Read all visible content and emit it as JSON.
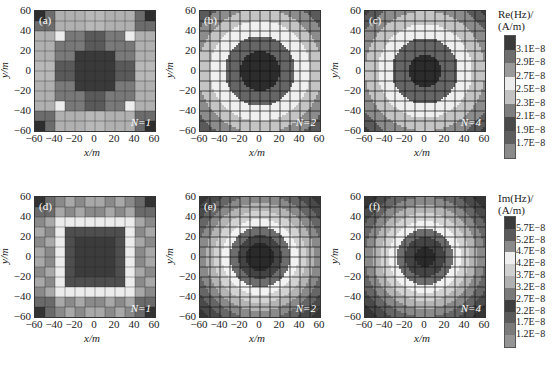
{
  "chart_data": [
    {
      "id": "a",
      "type": "heatmap",
      "panel_label": "(a)",
      "annotation": "N=1",
      "quantity": "Re(Hz)",
      "xlabel": "x/m",
      "ylabel": "y/m",
      "xlim": [
        -60,
        60
      ],
      "ylim": [
        -60,
        60
      ],
      "xticks": [
        -60,
        -40,
        -20,
        0,
        20,
        40,
        60
      ],
      "yticks": [
        -60,
        -40,
        -20,
        0,
        20,
        40,
        60
      ],
      "style": "blocky",
      "grid": true
    },
    {
      "id": "b",
      "type": "heatmap",
      "panel_label": "(b)",
      "annotation": "N=2",
      "quantity": "Re(Hz)",
      "xlabel": "x/m",
      "ylabel": "y/m",
      "xlim": [
        -60,
        60
      ],
      "ylim": [
        -60,
        60
      ],
      "xticks": [
        -60,
        -40,
        -20,
        0,
        20,
        40,
        60
      ],
      "yticks": [
        -60,
        -40,
        -20,
        0,
        20,
        40,
        60
      ],
      "style": "concentric contours",
      "grid": true
    },
    {
      "id": "c",
      "type": "heatmap",
      "panel_label": "(c)",
      "annotation": "N=4",
      "quantity": "Re(Hz)",
      "xlabel": "x/m",
      "ylabel": "y/m",
      "xlim": [
        -60,
        60
      ],
      "ylim": [
        -60,
        60
      ],
      "xticks": [
        -60,
        -40,
        -20,
        0,
        20,
        40,
        60
      ],
      "yticks": [
        -60,
        -40,
        -20,
        0,
        20,
        40,
        60
      ],
      "style": "concentric contours",
      "grid": true
    },
    {
      "id": "d",
      "type": "heatmap",
      "panel_label": "(d)",
      "annotation": "N=1",
      "quantity": "Im(Hz)",
      "xlabel": "x/m",
      "ylabel": "y/m",
      "xlim": [
        -60,
        60
      ],
      "ylim": [
        -60,
        60
      ],
      "xticks": [
        -60,
        -40,
        -20,
        0,
        20,
        40,
        60
      ],
      "yticks": [
        -60,
        -40,
        -20,
        0,
        20,
        40,
        60
      ],
      "style": "blocky",
      "grid": true
    },
    {
      "id": "e",
      "type": "heatmap",
      "panel_label": "(e)",
      "annotation": "N=2",
      "quantity": "Im(Hz)",
      "xlabel": "x/m",
      "ylabel": "y/m",
      "xlim": [
        -60,
        60
      ],
      "ylim": [
        -60,
        60
      ],
      "xticks": [
        -60,
        -40,
        -20,
        0,
        20,
        40,
        60
      ],
      "yticks": [
        -60,
        -40,
        -20,
        0,
        20,
        40,
        60
      ],
      "style": "concentric contours",
      "grid": true
    },
    {
      "id": "f",
      "type": "heatmap",
      "panel_label": "(f)",
      "annotation": "N=4",
      "quantity": "Im(Hz)",
      "xlabel": "x/m",
      "ylabel": "y/m",
      "xlim": [
        -60,
        60
      ],
      "ylim": [
        -60,
        60
      ],
      "xticks": [
        -60,
        -40,
        -20,
        0,
        20,
        40,
        60
      ],
      "yticks": [
        -60,
        -40,
        -20,
        0,
        20,
        40,
        60
      ],
      "style": "concentric contours",
      "grid": true
    }
  ],
  "colorbars": {
    "re": {
      "title_line1": "Re(Hz)/",
      "title_line2": "(A/m)",
      "levels": [
        "3.1E−8",
        "2.9E−8",
        "2.7E−8",
        "2.5E−8",
        "2.3E−8",
        "2.1E−8",
        "1.9E−8",
        "1.7E−8"
      ],
      "colors": [
        "#3a3a3a",
        "#6e6e6e",
        "#9a9a9a",
        "#ececec",
        "#c2c2c2",
        "#7e7e7e",
        "#4a4a4a",
        "#5e5e5e",
        "#8a8a8a"
      ]
    },
    "im": {
      "title_line1": "Im(Hz)/",
      "title_line2": "(A/m)",
      "levels": [
        "5.7E−8",
        "5.2E−8",
        "4.7E−8",
        "4.2E−8",
        "3.7E−8",
        "3.2E−8",
        "2.7E−8",
        "2.2E−8",
        "1.7E−8",
        "1.2E−8"
      ],
      "colors": [
        "#3a3a3a",
        "#5a5a5a",
        "#8a8a8a",
        "#efefef",
        "#d0d0d0",
        "#b0b0b0",
        "#7a7a7a",
        "#3e3e3e",
        "#5a5a5a",
        "#7a7a7a",
        "#949494"
      ]
    }
  },
  "labels": {
    "xlabel": "x/m",
    "ylabel": "y/m",
    "ticks": [
      "60",
      "40",
      "20",
      "0",
      "−20",
      "−40",
      "−60"
    ],
    "xticks": [
      "−60",
      "−40",
      "−20",
      "0",
      "20",
      "40",
      "60"
    ]
  }
}
